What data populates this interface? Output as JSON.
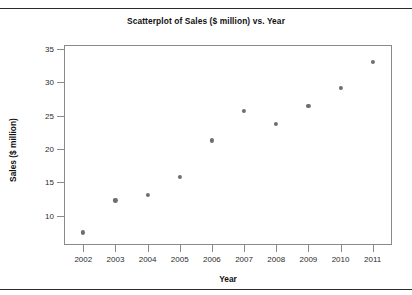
{
  "chart_data": {
    "type": "scatter",
    "title": "Scatterplot of Sales ($ million) vs. Year",
    "xlabel": "Year",
    "ylabel": "Sales ($ million)",
    "x": [
      2002,
      2003,
      2004,
      2005,
      2006,
      2007,
      2008,
      2009,
      2010,
      2011
    ],
    "values": [
      7.5,
      12.3,
      13.1,
      15.8,
      21.3,
      25.7,
      23.8,
      26.5,
      29.2,
      33.1
    ],
    "series": [
      {
        "name": "Sales",
        "points": [
          {
            "x": 2002,
            "y": 7.5
          },
          {
            "x": 2003,
            "y": 12.3
          },
          {
            "x": 2004,
            "y": 13.1
          },
          {
            "x": 2005,
            "y": 15.8
          },
          {
            "x": 2006,
            "y": 21.3
          },
          {
            "x": 2007,
            "y": 25.7
          },
          {
            "x": 2008,
            "y": 23.8
          },
          {
            "x": 2009,
            "y": 26.5
          },
          {
            "x": 2010,
            "y": 29.2
          },
          {
            "x": 2011,
            "y": 33.1
          }
        ]
      }
    ],
    "xtick_labels": [
      "2002",
      "2003",
      "2004",
      "2005",
      "2006",
      "2007",
      "2008",
      "2009",
      "2010",
      "2011"
    ],
    "ytick_labels": [
      "10",
      "15",
      "20",
      "25",
      "30",
      "35"
    ],
    "yticks": [
      10,
      15,
      20,
      25,
      30,
      35
    ],
    "xlim": [
      2001.4,
      2011.6
    ],
    "ylim": [
      5.6,
      35.6
    ],
    "grid": false,
    "legend": false,
    "marker_color": "#6e6e6e",
    "frame_color": "#8a8a8a",
    "rule_color": "#2b2b2b"
  }
}
